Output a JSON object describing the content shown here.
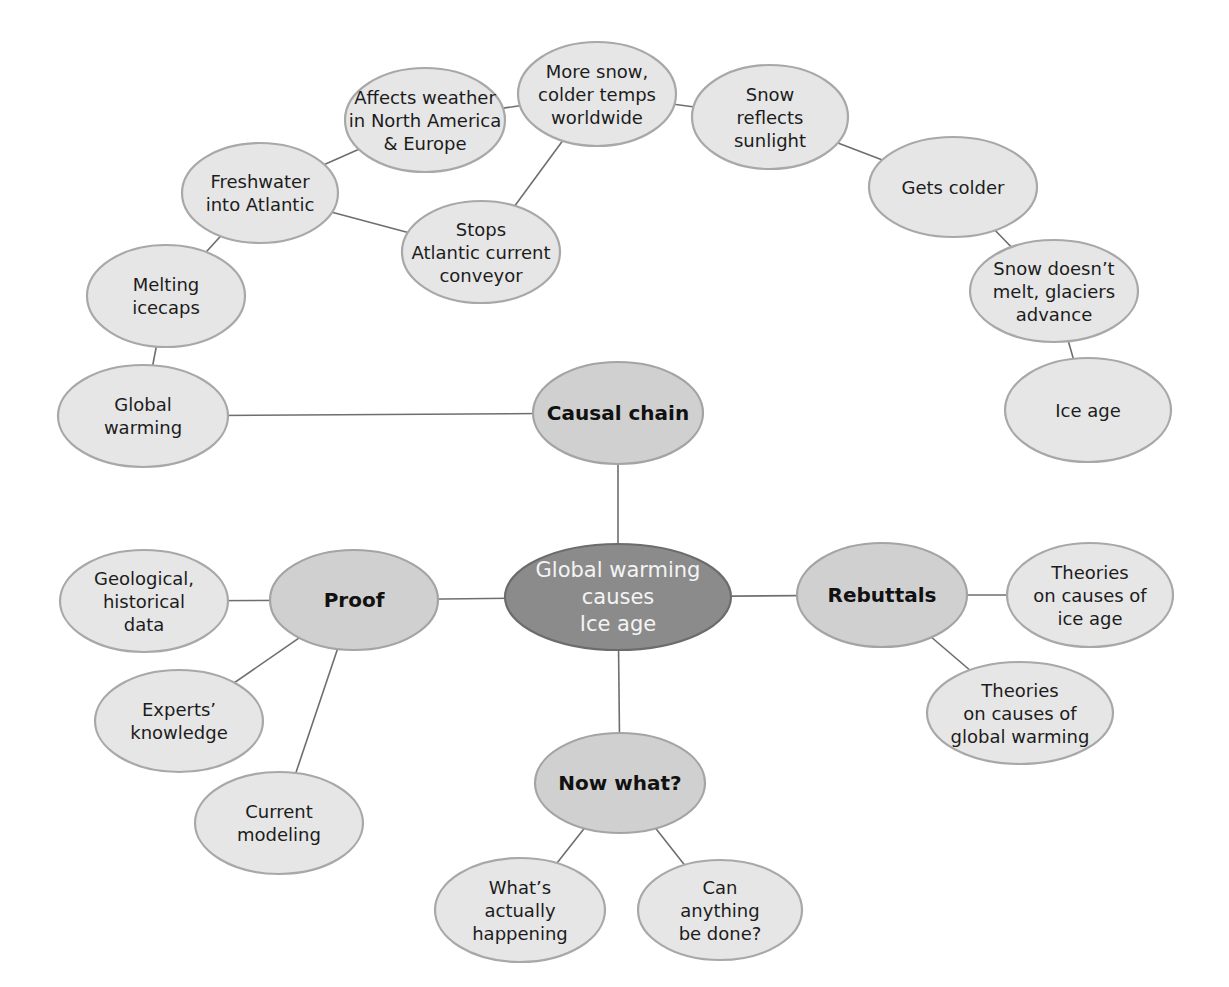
{
  "diagram": {
    "type": "concept-map",
    "colors": {
      "center_fill": "#8b8b8b",
      "center_text": "#f4f4f4",
      "branch_fill": "#d0d0d0",
      "leaf_fill": "#e6e6e6",
      "outline": "#a8a8a8",
      "edge": "#6e6e6e"
    },
    "nodes": [
      {
        "id": "center",
        "kind": "center",
        "cx": 618,
        "cy": 597,
        "rx": 113,
        "ry": 53,
        "lines": [
          "Global warming",
          "causes",
          "Ice age"
        ]
      },
      {
        "id": "causal-chain",
        "kind": "branch",
        "cx": 618,
        "cy": 413,
        "rx": 85,
        "ry": 51,
        "lines": [
          "Causal chain"
        ]
      },
      {
        "id": "proof",
        "kind": "branch",
        "cx": 354,
        "cy": 600,
        "rx": 84,
        "ry": 50,
        "lines": [
          "Proof"
        ]
      },
      {
        "id": "rebuttals",
        "kind": "branch",
        "cx": 882,
        "cy": 595,
        "rx": 85,
        "ry": 52,
        "lines": [
          "Rebuttals"
        ]
      },
      {
        "id": "now-what",
        "kind": "branch",
        "cx": 620,
        "cy": 783,
        "rx": 85,
        "ry": 50,
        "lines": [
          "Now what?"
        ]
      },
      {
        "id": "global-warming",
        "kind": "leaf",
        "cx": 143,
        "cy": 416,
        "rx": 85,
        "ry": 51,
        "lines": [
          "Global",
          "warming"
        ]
      },
      {
        "id": "melting-icecaps",
        "kind": "leaf",
        "cx": 166,
        "cy": 296,
        "rx": 79,
        "ry": 51,
        "lines": [
          "Melting",
          "icecaps"
        ]
      },
      {
        "id": "freshwater",
        "kind": "leaf",
        "cx": 260,
        "cy": 193,
        "rx": 78,
        "ry": 50,
        "lines": [
          "Freshwater",
          "into Atlantic"
        ]
      },
      {
        "id": "stops-current",
        "kind": "leaf",
        "cx": 481,
        "cy": 252,
        "rx": 79,
        "ry": 51,
        "lines": [
          "Stops",
          "Atlantic current",
          "conveyor"
        ]
      },
      {
        "id": "affects-weather",
        "kind": "leaf",
        "cx": 425,
        "cy": 120,
        "rx": 80,
        "ry": 52,
        "lines": [
          "Affects weather",
          "in North America",
          "& Europe"
        ]
      },
      {
        "id": "more-snow",
        "kind": "leaf",
        "cx": 597,
        "cy": 94,
        "rx": 79,
        "ry": 52,
        "lines": [
          "More snow,",
          "colder temps",
          "worldwide"
        ]
      },
      {
        "id": "snow-reflects",
        "kind": "leaf",
        "cx": 770,
        "cy": 117,
        "rx": 78,
        "ry": 52,
        "lines": [
          "Snow",
          "reflects",
          "sunlight"
        ]
      },
      {
        "id": "gets-colder",
        "kind": "leaf",
        "cx": 953,
        "cy": 187,
        "rx": 84,
        "ry": 50,
        "lines": [
          "Gets colder"
        ]
      },
      {
        "id": "snow-doesnt-melt",
        "kind": "leaf",
        "cx": 1054,
        "cy": 291,
        "rx": 84,
        "ry": 51,
        "lines": [
          "Snow doesn’t",
          "melt, glaciers",
          "advance"
        ]
      },
      {
        "id": "ice-age",
        "kind": "leaf",
        "cx": 1088,
        "cy": 410,
        "rx": 83,
        "ry": 52,
        "lines": [
          "Ice age"
        ]
      },
      {
        "id": "geological",
        "kind": "leaf",
        "cx": 144,
        "cy": 601,
        "rx": 84,
        "ry": 51,
        "lines": [
          "Geological,",
          "historical",
          "data"
        ]
      },
      {
        "id": "experts",
        "kind": "leaf",
        "cx": 179,
        "cy": 721,
        "rx": 84,
        "ry": 51,
        "lines": [
          "Experts’",
          "knowledge"
        ]
      },
      {
        "id": "current-modeling",
        "kind": "leaf",
        "cx": 279,
        "cy": 823,
        "rx": 84,
        "ry": 51,
        "lines": [
          "Current",
          "modeling"
        ]
      },
      {
        "id": "theories-ice-age",
        "kind": "leaf",
        "cx": 1090,
        "cy": 595,
        "rx": 83,
        "ry": 52,
        "lines": [
          "Theories",
          "on causes of",
          "ice age"
        ]
      },
      {
        "id": "theories-global-warming",
        "kind": "leaf",
        "cx": 1020,
        "cy": 713,
        "rx": 93,
        "ry": 51,
        "lines": [
          "Theories",
          "on causes of",
          "global warming"
        ]
      },
      {
        "id": "whats-happening",
        "kind": "leaf",
        "cx": 520,
        "cy": 910,
        "rx": 85,
        "ry": 52,
        "lines": [
          "What’s",
          "actually",
          "happening"
        ]
      },
      {
        "id": "can-anything",
        "kind": "leaf",
        "cx": 720,
        "cy": 910,
        "rx": 82,
        "ry": 50,
        "lines": [
          "Can",
          "anything",
          "be done?"
        ]
      }
    ],
    "edges": [
      [
        "center",
        "causal-chain"
      ],
      [
        "center",
        "proof"
      ],
      [
        "center",
        "rebuttals"
      ],
      [
        "center",
        "now-what"
      ],
      [
        "causal-chain",
        "global-warming"
      ],
      [
        "global-warming",
        "melting-icecaps"
      ],
      [
        "melting-icecaps",
        "freshwater"
      ],
      [
        "freshwater",
        "affects-weather"
      ],
      [
        "freshwater",
        "stops-current"
      ],
      [
        "stops-current",
        "more-snow"
      ],
      [
        "affects-weather",
        "more-snow"
      ],
      [
        "more-snow",
        "snow-reflects"
      ],
      [
        "snow-reflects",
        "gets-colder"
      ],
      [
        "gets-colder",
        "snow-doesnt-melt"
      ],
      [
        "snow-doesnt-melt",
        "ice-age"
      ],
      [
        "proof",
        "geological"
      ],
      [
        "proof",
        "experts"
      ],
      [
        "proof",
        "current-modeling"
      ],
      [
        "rebuttals",
        "theories-ice-age"
      ],
      [
        "rebuttals",
        "theories-global-warming"
      ],
      [
        "now-what",
        "whats-happening"
      ],
      [
        "now-what",
        "can-anything"
      ]
    ]
  }
}
